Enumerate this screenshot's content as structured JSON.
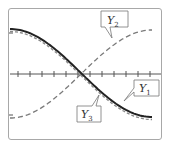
{
  "chart_data": {
    "type": "line",
    "title": "",
    "xlabel": "",
    "ylabel": "",
    "grid": false,
    "x_ticks_count": 12,
    "series": [
      {
        "name": "Y1",
        "style": "solid-thick",
        "color": "#222222",
        "shape": "decreasing cosine-like, from max to min"
      },
      {
        "name": "Y2",
        "style": "dashed",
        "color": "#777777",
        "shape": "increasing, from min to max"
      },
      {
        "name": "Y3",
        "style": "dashed",
        "color": "#777777",
        "shape": "decreasing, nearly coincident with Y1"
      }
    ],
    "labels": {
      "y1": {
        "main": "Y",
        "sub": "1"
      },
      "y2": {
        "main": "Y",
        "sub": "2"
      },
      "y3": {
        "main": "Y",
        "sub": "3"
      }
    }
  }
}
